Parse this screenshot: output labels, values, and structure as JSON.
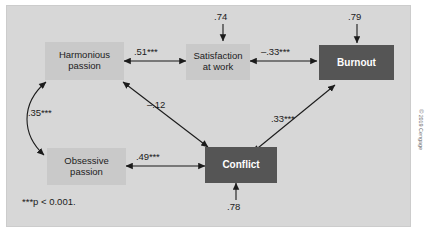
{
  "figure": {
    "background_color": "#d7d7d7",
    "node_light_color": "#c9c9c9",
    "node_dark_color": "#555555",
    "line_color": "#1b1b1b",
    "footnote": "***p < 0.001.",
    "copyright": "© 2019 Cengage"
  },
  "nodes": [
    {
      "id": "harmonious",
      "line1": "Harmonious",
      "line2": "passion",
      "style": "light"
    },
    {
      "id": "satisfaction",
      "line1": "Satisfaction",
      "line2": "at work",
      "style": "light"
    },
    {
      "id": "burnout",
      "line1": "Burnout",
      "line2": "",
      "style": "dark"
    },
    {
      "id": "obsessive",
      "line1": "Obsessive",
      "line2": "passion",
      "style": "light"
    },
    {
      "id": "conflict",
      "line1": "Conflict",
      "line2": "",
      "style": "dark"
    }
  ],
  "paths": [
    {
      "id": "harmonious-satisfaction",
      "label": ".51***",
      "arrow": "double"
    },
    {
      "id": "satisfaction-burnout",
      "label": "–.33***",
      "arrow": "double"
    },
    {
      "id": "harmonious-obsessive",
      "label": ".35***",
      "arrow": "double-curved"
    },
    {
      "id": "conflict-harmonious",
      "label": "–.12",
      "arrow": "double"
    },
    {
      "id": "obsessive-conflict",
      "label": ".49***",
      "arrow": "double"
    },
    {
      "id": "conflict-burnout",
      "label": ".33***",
      "arrow": "double"
    }
  ],
  "disturbances": [
    {
      "id": "satisfaction-disturbance",
      "label": ".74",
      "target": "satisfaction"
    },
    {
      "id": "burnout-disturbance",
      "label": ".79",
      "target": "burnout"
    },
    {
      "id": "conflict-disturbance",
      "label": ".78",
      "target": "conflict"
    }
  ]
}
